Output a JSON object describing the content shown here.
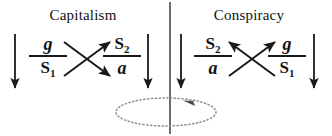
{
  "diagram": {
    "title_left": "Capitalism",
    "title_right": "Conspiracy",
    "background_color": "#ffffff",
    "ink_color": "#1a1a1a",
    "dotted_color": "#8c8c8c"
  },
  "left_panel": {
    "title": "Capitalism",
    "left_fraction": {
      "numerator": "g",
      "numerator_style": "italic",
      "denominator_base": "S",
      "denominator_sub": "1"
    },
    "right_fraction": {
      "numerator_base": "S",
      "numerator_sub": "2",
      "denominator": "a",
      "denominator_style": "italic"
    },
    "left_arrow": "down-arrow",
    "right_arrow": "down-arrow",
    "cross": "x-cross-arrows-right"
  },
  "right_panel": {
    "title": "Conspiracy",
    "left_fraction": {
      "numerator_base": "S",
      "numerator_sub": "2",
      "denominator": "a",
      "denominator_style": "italic"
    },
    "right_fraction": {
      "numerator": "g",
      "numerator_style": "italic",
      "denominator_base": "S",
      "denominator_sub": "1"
    },
    "left_arrow": "down-arrow",
    "right_arrow": "down-arrow",
    "cross": "x-cross-arrows-up"
  },
  "divider": {
    "name": "vertical-divider"
  },
  "rotation": {
    "name": "dotted-rotation-ellipse",
    "direction": "counterclockwise"
  }
}
